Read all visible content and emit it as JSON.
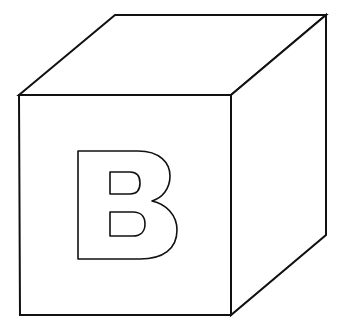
{
  "image": {
    "subject": "Line drawing of a toy block (cube) with a letter on its front face",
    "letter": "B",
    "stroke_color": "#111111",
    "fill_color": "#ffffff",
    "background": "#ffffff"
  }
}
